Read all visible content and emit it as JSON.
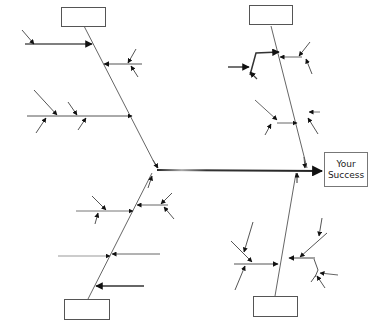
{
  "diagram": {
    "type": "fishbone",
    "effect": {
      "line1": "Your",
      "line2": "Success"
    },
    "categories": [
      {
        "position": "top-left",
        "label": ""
      },
      {
        "position": "top-right",
        "label": ""
      },
      {
        "position": "bottom-left",
        "label": ""
      },
      {
        "position": "bottom-right",
        "label": ""
      }
    ],
    "colors": {
      "line": "#555555",
      "spine": "#222222",
      "arrowhead": "#111111",
      "box_border": "#555555",
      "tail_gradient": [
        "#2ad0e0",
        "#111111",
        "#e83a4a"
      ]
    }
  }
}
